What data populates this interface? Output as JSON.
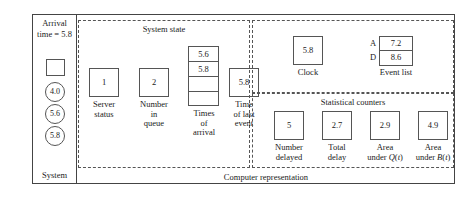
{
  "figure": {
    "type": "discrete-event-simulation-state-diagram"
  },
  "system_panel": {
    "header_line1": "Arrival",
    "header_line2": "time = 5.8",
    "footer_label": "System",
    "server_box_value": "",
    "customers": [
      "4.0",
      "5.6",
      "5.8"
    ]
  },
  "computer_representation": {
    "caption": "Computer representation",
    "system_state": {
      "title": "System state",
      "server_status": {
        "value": "1",
        "label_line1": "Server",
        "label_line2": "status"
      },
      "number_in_queue": {
        "value": "2",
        "label_line1": "Number",
        "label_line2": "in",
        "label_line3": "queue"
      },
      "times_of_arrival": {
        "cells": [
          "5.6",
          "5.8",
          "",
          ""
        ],
        "label_line1": "Times",
        "label_line2": "of",
        "label_line3": "arrival"
      },
      "time_of_last_event": {
        "value": "5.8",
        "label_line1": "Time",
        "label_line2": "of last",
        "label_line3": "event"
      }
    },
    "clock_and_events": {
      "clock": {
        "value": "5.8",
        "label": "Clock"
      },
      "event_list": {
        "label": "Event list",
        "rows": [
          {
            "key": "A",
            "time": "7.2"
          },
          {
            "key": "D",
            "time": "8.6"
          }
        ]
      }
    },
    "statistical_counters": {
      "title": "Statistical counters",
      "counters": [
        {
          "value": "5",
          "label_line1": "Number",
          "label_line2": "delayed"
        },
        {
          "value": "2.7",
          "label_line1": "Total",
          "label_line2": "delay"
        },
        {
          "value": "2.9",
          "label_line1": "Area",
          "label_line2": "under Q(t)"
        },
        {
          "value": "4.9",
          "label_line1": "Area",
          "label_line2": "under B(t)"
        }
      ]
    }
  }
}
